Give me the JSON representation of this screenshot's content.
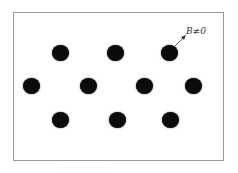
{
  "figure": {
    "annotation": "B≠0",
    "caption": "· · · · · · · · · · · · ·",
    "dots": [
      {
        "row": 1,
        "x": 60,
        "y": 53
      },
      {
        "row": 1,
        "x": 115,
        "y": 53
      },
      {
        "row": 1,
        "x": 169,
        "y": 53
      },
      {
        "row": 2,
        "x": 31,
        "y": 86
      },
      {
        "row": 2,
        "x": 88,
        "y": 86
      },
      {
        "row": 2,
        "x": 144,
        "y": 86
      },
      {
        "row": 2,
        "x": 193,
        "y": 86
      },
      {
        "row": 3,
        "x": 60,
        "y": 120
      },
      {
        "row": 3,
        "x": 117,
        "y": 120
      },
      {
        "row": 3,
        "x": 170,
        "y": 120
      }
    ],
    "colors": {
      "dot": "#0b0b0b",
      "frame": "#9a9a9a"
    }
  }
}
